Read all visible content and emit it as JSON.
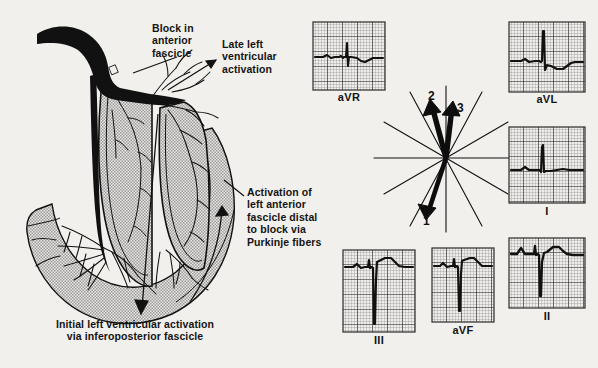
{
  "figure": {
    "background_color": "#f2f0ed",
    "ink_color": "#141414",
    "myocardium_fill": "#b9b9b9"
  },
  "annotations": [
    {
      "id": "block-in-anterior-fascicle",
      "text": "Block in\nanterior\nfascicle",
      "x": 152,
      "y": 22,
      "leader": {
        "from": [
          178,
          58
        ],
        "to": [
          131,
          72
        ]
      }
    },
    {
      "id": "late-left-ventricular-activation",
      "text": "Late left\nventricular\nactivation",
      "x": 222,
      "y": 38,
      "leader": {
        "from": [
          219,
          62
        ],
        "to": [
          174,
          86
        ]
      }
    },
    {
      "id": "activation-of-left-anterior-fascicle",
      "text": "Activation of\nleft anterior\nfascicle distal\nto block via\nPurkinje fibers",
      "x": 247,
      "y": 186,
      "leader": {
        "from": [
          244,
          196
        ],
        "to": [
          222,
          180
        ]
      }
    },
    {
      "id": "initial-left-ventricular-activation",
      "text": "Initial left ventricular activation\nvia inferoposterior fascicle",
      "x": 56,
      "y": 318,
      "leader": {
        "from": [
          157,
          115
        ],
        "to": [
          141,
          312
        ]
      }
    }
  ],
  "vector_diagram": {
    "name": "hexaxial-reference-vector-loop",
    "center": [
      446,
      158
    ],
    "radius": 72,
    "axes_count": 6,
    "axis_angles_deg": [
      0,
      30,
      60,
      90,
      120,
      150
    ],
    "vectors": [
      {
        "label": "1",
        "angle_deg": 255,
        "length": 58,
        "label_x": 423,
        "label_y": 220,
        "description": "initial inferior-rightward forces"
      },
      {
        "label": "2",
        "angle_deg": 108,
        "length": 62,
        "label_x": 428,
        "label_y": 92,
        "description": "mid superior-leftward forces"
      },
      {
        "label": "3",
        "angle_deg": 97,
        "length": 66,
        "label_x": 454,
        "label_y": 104,
        "description": "terminal superior-leftward forces"
      }
    ]
  },
  "ecg_panels": [
    {
      "lead": "aVR",
      "name": "ecg-panel-avr",
      "x": 313,
      "y": 22,
      "w": 72,
      "h": 68,
      "label_x": 313,
      "label_y": 91,
      "label_w": 72,
      "baseline_pct": 52,
      "qrs": {
        "q_depth": 6,
        "r_height": 26,
        "s_depth": 14,
        "t_amplitude": -6,
        "p_amplitude": 2
      },
      "morphology": "small rS with terminal r, inverted T"
    },
    {
      "lead": "aVL",
      "name": "ecg-panel-avl",
      "x": 509,
      "y": 22,
      "w": 76,
      "h": 70,
      "label_x": 509,
      "label_y": 93,
      "label_w": 76,
      "baseline_pct": 55,
      "qrs": {
        "q_depth": 4,
        "r_height": 48,
        "s_depth": 10,
        "t_amplitude": -7,
        "p_amplitude": 2
      },
      "morphology": "tall qR with ST depression, inverted T"
    },
    {
      "lead": "I",
      "name": "ecg-panel-i",
      "x": 509,
      "y": 127,
      "w": 76,
      "h": 76,
      "label_x": 509,
      "label_y": 205,
      "label_w": 76,
      "baseline_pct": 56,
      "qrs": {
        "q_depth": 3,
        "r_height": 34,
        "s_depth": 6,
        "t_amplitude": 3,
        "p_amplitude": 4
      },
      "morphology": "qR pattern, upright small T"
    },
    {
      "lead": "III",
      "name": "ecg-panel-iii",
      "x": 343,
      "y": 250,
      "w": 72,
      "h": 82,
      "label_x": 343,
      "label_y": 334,
      "label_w": 72,
      "baseline_pct": 22,
      "qrs": {
        "q_depth": 2,
        "r_height": 14,
        "s_depth": 58,
        "t_amplitude": 11,
        "p_amplitude": 4
      },
      "morphology": "rS with very deep S wave, upright T"
    },
    {
      "lead": "aVF",
      "name": "ecg-panel-avf",
      "x": 432,
      "y": 248,
      "w": 62,
      "h": 74,
      "label_x": 432,
      "label_y": 324,
      "label_w": 62,
      "baseline_pct": 24,
      "qrs": {
        "q_depth": 2,
        "r_height": 15,
        "s_depth": 48,
        "t_amplitude": 10,
        "p_amplitude": 4
      },
      "morphology": "rS with deep S wave, upright T"
    },
    {
      "lead": "II",
      "name": "ecg-panel-ii",
      "x": 509,
      "y": 238,
      "w": 76,
      "h": 70,
      "label_x": 509,
      "label_y": 310,
      "label_w": 76,
      "baseline_pct": 26,
      "qrs": {
        "q_depth": 2,
        "r_height": 16,
        "s_depth": 38,
        "t_amplitude": 13,
        "p_amplitude": 6
      },
      "morphology": "rS with deep S wave, prominent upright T"
    }
  ],
  "ecg_grid": {
    "small_cell_px": 3,
    "bold_every": 5,
    "fine_color": "#8b8b8b",
    "bold_color": "#2a2a2a",
    "trace_color": "#111111"
  }
}
